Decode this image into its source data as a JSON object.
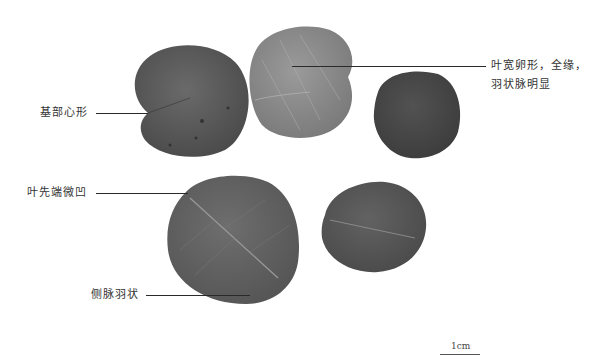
{
  "figure": {
    "leaf_count": 5,
    "colors": {
      "background": "#ffffff",
      "leaf_dark": "#4a4a4a",
      "leaf_mid": "#5e5e5e",
      "leaf_light": "#858585",
      "leader_line": "#2a2a2a"
    }
  },
  "annotations": {
    "base_cordate": "基部心形",
    "leaf_shape_line1": "叶宽卵形，全缘，",
    "leaf_shape_line2": "羽状脉明显",
    "apex_emarginate": "叶先端微凹",
    "lateral_veins_pinnate": "侧脉羽状"
  },
  "scale_bar": {
    "label": "1cm"
  }
}
